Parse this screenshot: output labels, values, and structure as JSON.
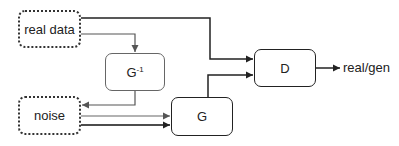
{
  "diagram": {
    "type": "GAN architecture with inverse generator",
    "nodes": {
      "real_data": {
        "label": "real data",
        "style": "dotted"
      },
      "noise": {
        "label": "noise",
        "style": "dotted"
      },
      "g_inverse": {
        "label": "G",
        "superscript": "-1",
        "style": "solid-gray"
      },
      "generator": {
        "label": "G",
        "style": "solid"
      },
      "discriminator": {
        "label": "D",
        "style": "solid"
      }
    },
    "output_label": "real/gen",
    "edges": [
      {
        "from": "real_data",
        "to": "discriminator",
        "color": "#222222"
      },
      {
        "from": "real_data",
        "to": "g_inverse",
        "color": "#555555"
      },
      {
        "from": "g_inverse",
        "to": "noise",
        "color": "#555555"
      },
      {
        "from": "noise",
        "to": "generator",
        "color": "#666666"
      },
      {
        "from": "noise",
        "to": "generator",
        "color": "#111111"
      },
      {
        "from": "generator",
        "to": "discriminator",
        "color": "#222222"
      },
      {
        "from": "discriminator",
        "to": "output",
        "color": "#222222"
      }
    ]
  }
}
